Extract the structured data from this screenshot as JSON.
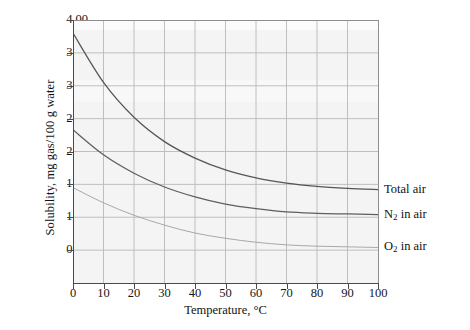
{
  "chart_data": {
    "type": "line",
    "title": "",
    "xlabel": "Temperature, °C",
    "ylabel": "Solubility, mg gas/100 g water",
    "xlim": [
      0,
      100
    ],
    "ylim": [
      0,
      4.0
    ],
    "xticks": [
      0,
      10,
      20,
      30,
      40,
      50,
      60,
      70,
      80,
      90,
      100
    ],
    "xtick_labels": [
      "0",
      "10",
      "20",
      "30",
      "40",
      "50",
      "60",
      "70",
      "80",
      "90",
      "100"
    ],
    "yticks": [
      0.5,
      1.0,
      1.5,
      2.0,
      2.5,
      3.0,
      3.5,
      4.0
    ],
    "ytick_labels": [
      "0.50",
      "1.00",
      "1.50",
      "2.00",
      "2.50",
      "3.00",
      "3.50",
      "4.00"
    ],
    "grid": true,
    "legend_position": "right-of-axes-inline",
    "x": [
      0,
      10,
      20,
      30,
      40,
      50,
      60,
      70,
      80,
      90,
      100
    ],
    "series": [
      {
        "name": "Total air",
        "label": "Total air",
        "color": "#555555",
        "values": [
          3.8,
          3.05,
          2.52,
          2.15,
          1.9,
          1.72,
          1.6,
          1.52,
          1.47,
          1.44,
          1.42
        ]
      },
      {
        "name": "N2 in air",
        "label_main": "N",
        "label_sub": "2",
        "label_tail": " in air",
        "color": "#5e5e5e",
        "values": [
          2.33,
          1.95,
          1.67,
          1.46,
          1.31,
          1.2,
          1.13,
          1.08,
          1.06,
          1.05,
          1.04
        ]
      },
      {
        "name": "O2 in air",
        "label_main": "O",
        "label_sub": "2",
        "label_tail": " in air",
        "color": "#a8a8a8",
        "values": [
          1.45,
          1.22,
          1.03,
          0.88,
          0.76,
          0.68,
          0.62,
          0.58,
          0.56,
          0.55,
          0.54
        ]
      }
    ]
  },
  "axes": {
    "y_title": "Solubility, mg gas/100 g water",
    "x_title": "Temperature, °C"
  },
  "colors": {
    "plot_background": "#f4f4f4",
    "grid": "#b9b9b9",
    "axis": "#4a4a4a",
    "total_air": "#555555",
    "n2_in_air": "#5e5e5e",
    "o2_in_air": "#a8a8a8"
  }
}
